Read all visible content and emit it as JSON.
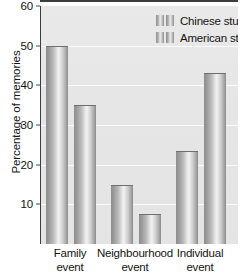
{
  "chart_data": {
    "type": "bar",
    "title": "",
    "xlabel": "",
    "ylabel": "Percentage of memories",
    "categories": [
      "Family event",
      "Neighbourhood event",
      "Individual event"
    ],
    "category_lines": [
      [
        "Family",
        "event"
      ],
      [
        "Neighbourhood",
        "event"
      ],
      [
        "Individual",
        "event"
      ]
    ],
    "series": [
      {
        "name": "Chinese students",
        "values": [
          50,
          15,
          23.5
        ]
      },
      {
        "name": "American students",
        "values": [
          35,
          7.5,
          43
        ]
      }
    ],
    "ylim": [
      0,
      60
    ],
    "yticks": [
      10,
      20,
      30,
      40,
      50,
      60
    ],
    "ytick_labels": [
      "10",
      "20",
      "30",
      "40",
      "50",
      "60"
    ],
    "grid": true,
    "grid_axis": "y",
    "legend_position": "top-right",
    "bar_style": "vertical-gradient-grayscale",
    "colors": {
      "plot_background": "#e6e6e6",
      "axis": "#3d3d3d",
      "gridline": "#ffffff",
      "bar_light": "#f2f2f2",
      "bar_dark": "#8a8a8a",
      "text": "#141414"
    }
  },
  "legend": {
    "items": [
      {
        "label": "Chinese students"
      },
      {
        "label": "American students"
      }
    ]
  },
  "axis": {
    "y_title": "Percentage of memories"
  }
}
